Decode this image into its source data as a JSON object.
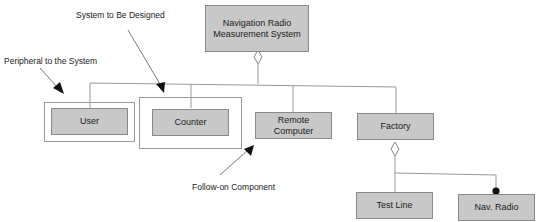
{
  "diagram": {
    "type": "class-hierarchy",
    "root": {
      "label": "Navigation Radio Measurement System"
    },
    "children": [
      {
        "label": "User"
      },
      {
        "label": "Counter"
      },
      {
        "label": "Remote Computer"
      },
      {
        "label": "Factory"
      }
    ],
    "factory_children": [
      {
        "label": "Test Line",
        "relation": "aggregation"
      },
      {
        "label": "Nav. Radio",
        "relation": "composition"
      }
    ],
    "annotations": {
      "peripheral": "Peripheral to the System",
      "system": "System to Be Designed",
      "follow_on": "Follow-on Component"
    },
    "colors": {
      "box_fill": "#c8c8c8",
      "line": "#999999",
      "arrow": "#111111"
    }
  }
}
